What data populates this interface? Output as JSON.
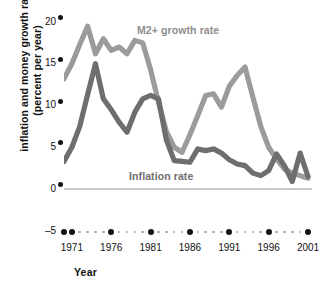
{
  "axes": {
    "ylabel_line1": "inflation and money growth rate",
    "ylabel_line2": "(percent per year)",
    "xlabel": "Year",
    "yticks": [
      "20",
      "15",
      "10",
      "5",
      "0",
      "–5"
    ],
    "xticks": [
      "1971",
      "1976",
      "1981",
      "1986",
      "1991",
      "1996",
      "2001"
    ]
  },
  "labels": {
    "m2": "M2+ growth rate",
    "inflation": "Inflation rate"
  },
  "colors": {
    "m2_line": "#9b9b9b",
    "inflation_line": "#6e6e6e",
    "zero_line": "#c9c9c9",
    "tick_dot": "#111111",
    "minor_dot": "#a8a8a8",
    "background": "#ffffff"
  },
  "chart_data": {
    "type": "line",
    "title": "",
    "xlabel": "Year",
    "ylabel": "inflation and money growth rate (percent per year)",
    "xlim": [
      1970,
      2001
    ],
    "ylim": [
      -5,
      20
    ],
    "yticks": [
      -5,
      0,
      5,
      10,
      15,
      20
    ],
    "xticks": [
      1971,
      1976,
      1981,
      1986,
      1991,
      1996,
      2001
    ],
    "grid": false,
    "legend": "inline-annotations",
    "x": [
      1970,
      1971,
      1972,
      1973,
      1974,
      1975,
      1976,
      1977,
      1978,
      1979,
      1980,
      1981,
      1982,
      1983,
      1984,
      1985,
      1986,
      1987,
      1988,
      1989,
      1990,
      1991,
      1992,
      1993,
      1994,
      1995,
      1996,
      1997,
      1998,
      1999,
      2000,
      2001
    ],
    "series": [
      {
        "name": "M2+ growth rate",
        "color": "#9b9b9b",
        "values": [
          13.2,
          15.0,
          17.3,
          19.5,
          16.2,
          18.0,
          16.6,
          17.0,
          16.2,
          17.8,
          17.5,
          14.3,
          10.4,
          6.9,
          5.0,
          4.4,
          6.5,
          8.8,
          11.2,
          11.4,
          9.8,
          12.3,
          13.6,
          14.6,
          11.0,
          7.5,
          5.0,
          3.6,
          2.4,
          1.9,
          1.6,
          1.3
        ]
      },
      {
        "name": "Inflation rate",
        "color": "#6e6e6e",
        "values": [
          3.3,
          5.0,
          7.5,
          11.3,
          15.0,
          10.8,
          9.5,
          8.0,
          6.8,
          9.2,
          10.8,
          11.2,
          10.8,
          5.9,
          3.4,
          3.3,
          3.2,
          4.8,
          4.6,
          4.8,
          4.3,
          3.5,
          3.0,
          2.8,
          1.9,
          1.6,
          2.2,
          4.2,
          2.8,
          0.9,
          4.3,
          1.5
        ]
      }
    ],
    "annotations": [
      {
        "text": "M2+ growth rate",
        "x": 1980,
        "y": 18.0
      },
      {
        "text": "Inflation rate",
        "x": 1980,
        "y": 1.2
      }
    ]
  }
}
